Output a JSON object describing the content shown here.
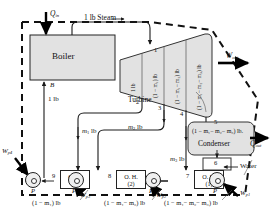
{
  "diagram": {
    "components": {
      "boiler": "Boiler",
      "turbine": "Turbine",
      "condenser": "Condenser",
      "heater3": {
        "name": "O. H.",
        "number": "(3)"
      },
      "heater2": {
        "name": "O. H.",
        "number": "(2)"
      },
      "heater1": {
        "name": "O. H.",
        "number": "(1)"
      }
    },
    "energy": {
      "q_in": "Q",
      "q_in_sub": "in",
      "q_out": "Q",
      "q_out_sub": "out",
      "w_out": "W",
      "w_out_sub": "out",
      "w_p1": "W",
      "w_p1_sub": "p1",
      "w_p2": "W",
      "w_p2_sub": "p2",
      "w_p3": "W",
      "w_p3_sub": "p3",
      "w_p4": "W",
      "w_p4_sub": "p4"
    },
    "flow_labels": {
      "steam_line": "1 lb  Steam",
      "feed_1lb": "1 lb",
      "extraction_m1": "m",
      "extraction_m1_sub": "1",
      "extraction_m1_unit": " lb",
      "extraction_m2": "m",
      "extraction_m2_sub": "2",
      "extraction_m2_unit": " lb",
      "extraction_m3": "m",
      "extraction_m3_sub": "3",
      "extraction_m3_unit": " lb",
      "water": "Water"
    },
    "turbine_segments": [
      {
        "label": "1 lb"
      },
      {
        "label": "(1 − m₁) lb"
      },
      {
        "label": "(1 − m₁− m₂) lb"
      },
      {
        "label": "(1 − m₁− m₂− m₃) lb"
      }
    ],
    "bottom_flow_labels": [
      {
        "label": "(1 − m₁) lb"
      },
      {
        "label": "(1 − m₁− m₂) lb"
      },
      {
        "label": "(1 − m₁− m₂− m₃) lb"
      }
    ],
    "condenser_flow": "(1 − m₁− m₂− m₃) lb.",
    "state_points": [
      "1",
      "2",
      "3",
      "4",
      "5",
      "6",
      "7",
      "8",
      "9"
    ],
    "markers": {
      "boiler_outlet": "B",
      "pump_symbol": "P"
    },
    "colors": {
      "line": "#1a1a1a",
      "component_fill": "#e2e2e2",
      "boundary": "#111111",
      "text": "#111111"
    }
  }
}
